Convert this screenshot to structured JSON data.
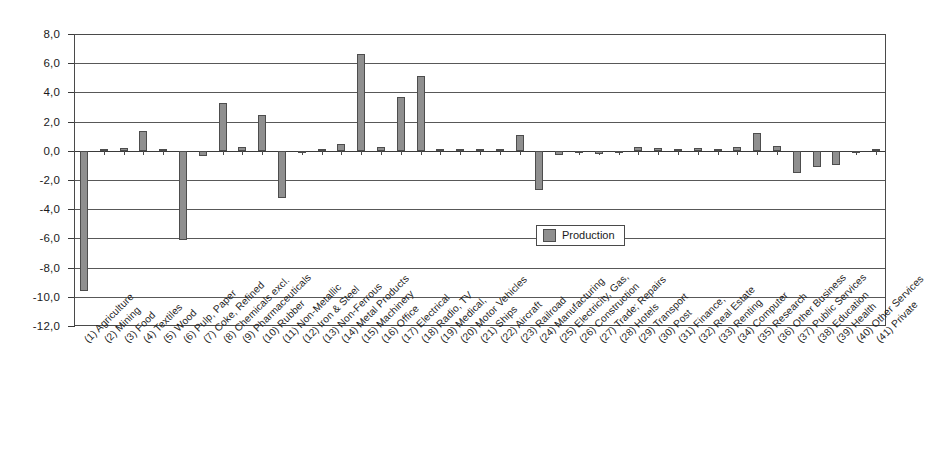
{
  "chart_data": {
    "type": "bar",
    "title": "",
    "xlabel": "",
    "ylabel": "",
    "ylim": [
      -12.0,
      8.0
    ],
    "ytick_step": 2.0,
    "grid": true,
    "legend_position": "inside-right",
    "decimal_separator": ",",
    "bar_color": "#8f8f8f",
    "bar_border_color": "#4d4d4d",
    "axis_color": "#4a4a4a",
    "ytick_labels": [
      "8,0",
      "6,0",
      "4,0",
      "2,0",
      "0,0",
      "-2,0",
      "-4,0",
      "-6,0",
      "-8,0",
      "-10,0",
      "-12,0"
    ],
    "ytick_values": [
      8.0,
      6.0,
      4.0,
      2.0,
      0.0,
      -2.0,
      -4.0,
      -6.0,
      -8.0,
      -10.0,
      -12.0
    ],
    "series": [
      {
        "name": "Production",
        "values": [
          -9.6,
          0.05,
          0.2,
          1.35,
          0.02,
          -6.1,
          -0.35,
          3.25,
          0.25,
          2.45,
          -3.2,
          -0.08,
          0.1,
          0.45,
          6.6,
          0.25,
          3.7,
          5.1,
          0.05,
          0.05,
          0.1,
          0.08,
          1.1,
          -2.7,
          -0.3,
          -0.18,
          -0.25,
          -0.15,
          0.25,
          0.2,
          0.1,
          0.2,
          0.05,
          0.25,
          1.2,
          0.3,
          -1.55,
          -1.1,
          -0.95,
          -0.05,
          0.02
        ]
      }
    ],
    "categories": [
      "(1) Agriculture",
      "(2) Mining",
      "(3) Food",
      "(4) Textiles",
      "(5) Wood",
      "(6) Pulp, Paper",
      "(7) Coke, Refined",
      "(8) Chemicals excl.",
      "(9) Pharmaceuticals",
      "(10) Rubber",
      "(11) Non-Metallic",
      "(12) Iron & Steel",
      "(13) Non-Ferrous",
      "(14) Metal Products",
      "(15) Machinery",
      "(16) Office",
      "(17) Electrical",
      "(18) Radio, TV",
      "(19) Medical,",
      "(20) Motor Vehicles",
      "(21) Ships",
      "(22) Aircraft",
      "(23) Railroad",
      "(24) Manufacturing",
      "(25) Electricity, Gas,",
      "(26) Construction",
      "(27) Trade; Repairs",
      "(28) Hotels",
      "(29) Transport",
      "(30) Post",
      "(31) Finance,",
      "(32) Real Estate",
      "(33) Renting",
      "(34) Computer",
      "(35) Research",
      "(36) Other Business",
      "(37) Public Services",
      "(38) Education",
      "(39) Health",
      "(40) Other Services",
      "(41) Private"
    ]
  },
  "legend": {
    "items": [
      {
        "label": "Production",
        "color": "#8f8f8f"
      }
    ]
  }
}
